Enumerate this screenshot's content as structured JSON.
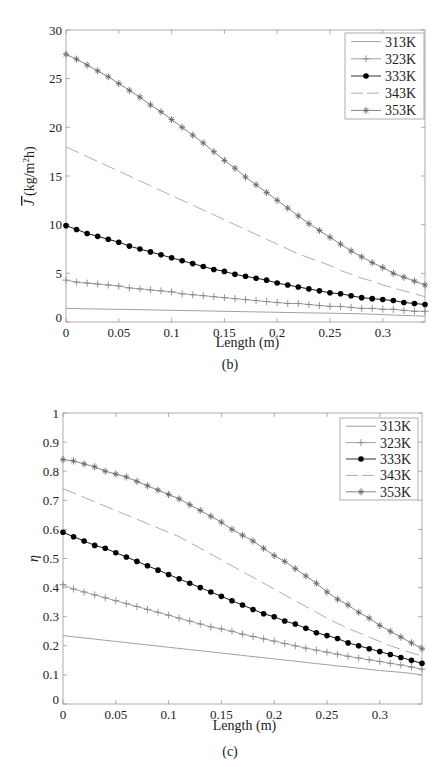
{
  "figure": {
    "panels": [
      "(b)",
      "(c)"
    ]
  },
  "chart_data": [
    {
      "id": "b",
      "type": "line",
      "caption": "(b)",
      "title": "",
      "xlabel": "Length (m)",
      "ylabel": "J̄ (kg/m²h)",
      "ylabel_parts": {
        "symbol": "J",
        "unit_pre": "(kg/m",
        "unit_sup": "2",
        "unit_post": "h)"
      },
      "xlim": [
        0,
        0.34
      ],
      "ylim": [
        0,
        30
      ],
      "xticks": [
        0,
        0.05,
        0.1,
        0.15,
        0.2,
        0.25,
        0.3
      ],
      "xtick_labels": [
        "0",
        "0.05",
        "0.1",
        "0.15",
        "0.2",
        "0.25",
        "0.3"
      ],
      "yticks": [
        0,
        5,
        10,
        15,
        20,
        25,
        30
      ],
      "ytick_labels": [
        "0",
        "5",
        "10",
        "15",
        "20",
        "25",
        "30"
      ],
      "grid": false,
      "legend_position": "upper right",
      "x": [
        0,
        0.01,
        0.02,
        0.03,
        0.04,
        0.05,
        0.06,
        0.07,
        0.08,
        0.09,
        0.1,
        0.11,
        0.12,
        0.13,
        0.14,
        0.15,
        0.16,
        0.17,
        0.18,
        0.19,
        0.2,
        0.21,
        0.22,
        0.23,
        0.24,
        0.25,
        0.26,
        0.27,
        0.28,
        0.29,
        0.3,
        0.31,
        0.32,
        0.33,
        0.34
      ],
      "series": [
        {
          "name": "313K",
          "style": "solid",
          "marker": "none",
          "color": "#888888",
          "values": [
            1.4,
            1.38,
            1.36,
            1.34,
            1.32,
            1.3,
            1.28,
            1.26,
            1.24,
            1.22,
            1.2,
            1.18,
            1.16,
            1.14,
            1.12,
            1.1,
            1.08,
            1.06,
            1.04,
            1.02,
            1.0,
            0.98,
            0.96,
            0.94,
            0.92,
            0.9,
            0.88,
            0.86,
            0.84,
            0.8,
            0.76,
            0.72,
            0.68,
            0.64,
            0.6
          ]
        },
        {
          "name": "323K",
          "style": "solid",
          "marker": "plus",
          "color": "#888888",
          "values": [
            4.3,
            4.1,
            4.0,
            3.9,
            3.8,
            3.7,
            3.5,
            3.4,
            3.3,
            3.2,
            3.1,
            2.9,
            2.8,
            2.7,
            2.6,
            2.5,
            2.4,
            2.3,
            2.2,
            2.1,
            2.0,
            1.9,
            1.9,
            1.8,
            1.7,
            1.6,
            1.6,
            1.5,
            1.4,
            1.4,
            1.3,
            1.3,
            1.2,
            1.1,
            1.1
          ]
        },
        {
          "name": "333K",
          "style": "solid",
          "marker": "dot",
          "color": "#000000",
          "values": [
            9.9,
            9.5,
            9.1,
            8.8,
            8.5,
            8.2,
            7.8,
            7.5,
            7.2,
            6.9,
            6.6,
            6.3,
            6.0,
            5.7,
            5.4,
            5.2,
            4.9,
            4.7,
            4.5,
            4.3,
            4.0,
            3.8,
            3.6,
            3.4,
            3.2,
            3.0,
            2.9,
            2.7,
            2.5,
            2.4,
            2.3,
            2.2,
            2.0,
            1.9,
            1.8
          ]
        },
        {
          "name": "343K",
          "style": "dashed",
          "marker": "none",
          "color": "#999999",
          "values": [
            18.0,
            17.5,
            17.0,
            16.5,
            16.0,
            15.5,
            15.0,
            14.5,
            14.0,
            13.5,
            13.0,
            12.5,
            12.0,
            11.5,
            11.0,
            10.5,
            10.0,
            9.5,
            9.0,
            8.5,
            8.0,
            7.5,
            7.0,
            6.6,
            6.2,
            5.8,
            5.3,
            4.9,
            4.5,
            4.2,
            3.8,
            3.5,
            3.2,
            2.9,
            2.6
          ]
        },
        {
          "name": "353K",
          "style": "solid",
          "marker": "star",
          "color": "#666666",
          "values": [
            27.5,
            27.0,
            26.4,
            25.8,
            25.2,
            24.5,
            23.8,
            23.1,
            22.3,
            21.6,
            20.8,
            20.0,
            19.2,
            18.4,
            17.5,
            16.6,
            15.8,
            14.9,
            14.1,
            13.3,
            12.5,
            11.7,
            10.9,
            10.1,
            9.4,
            8.7,
            8.0,
            7.3,
            6.7,
            6.1,
            5.6,
            5.0,
            4.6,
            4.2,
            3.8
          ]
        }
      ]
    },
    {
      "id": "c",
      "type": "line",
      "caption": "(c)",
      "title": "",
      "xlabel": "Length (m)",
      "ylabel": "η",
      "xlim": [
        0,
        0.34
      ],
      "ylim": [
        0,
        1
      ],
      "xticks": [
        0,
        0.05,
        0.1,
        0.15,
        0.2,
        0.25,
        0.3
      ],
      "xtick_labels": [
        "0",
        "0.05",
        "0.1",
        "0.15",
        "0.2",
        "0.25",
        "0.3"
      ],
      "yticks": [
        0,
        0.1,
        0.2,
        0.3,
        0.4,
        0.5,
        0.6,
        0.7,
        0.8,
        0.9,
        1
      ],
      "ytick_labels": [
        "0",
        "0.1",
        "0.2",
        "0.3",
        "0.4",
        "0.5",
        "0.6",
        "0.7",
        "0.8",
        "0.9",
        "1"
      ],
      "grid": false,
      "legend_position": "upper right",
      "x": [
        0,
        0.01,
        0.02,
        0.03,
        0.04,
        0.05,
        0.06,
        0.07,
        0.08,
        0.09,
        0.1,
        0.11,
        0.12,
        0.13,
        0.14,
        0.15,
        0.16,
        0.17,
        0.18,
        0.19,
        0.2,
        0.21,
        0.22,
        0.23,
        0.24,
        0.25,
        0.26,
        0.27,
        0.28,
        0.29,
        0.3,
        0.31,
        0.32,
        0.33,
        0.34
      ],
      "series": [
        {
          "name": "313K",
          "style": "solid",
          "marker": "none",
          "color": "#888888",
          "values": [
            0.235,
            0.231,
            0.227,
            0.223,
            0.219,
            0.215,
            0.211,
            0.207,
            0.203,
            0.199,
            0.195,
            0.191,
            0.187,
            0.183,
            0.179,
            0.175,
            0.171,
            0.167,
            0.163,
            0.159,
            0.155,
            0.151,
            0.147,
            0.143,
            0.139,
            0.135,
            0.131,
            0.127,
            0.123,
            0.119,
            0.115,
            0.112,
            0.109,
            0.105,
            0.1
          ]
        },
        {
          "name": "323K",
          "style": "solid",
          "marker": "plus",
          "color": "#888888",
          "values": [
            0.41,
            0.395,
            0.385,
            0.375,
            0.365,
            0.355,
            0.345,
            0.335,
            0.325,
            0.315,
            0.305,
            0.295,
            0.285,
            0.275,
            0.265,
            0.258,
            0.25,
            0.24,
            0.232,
            0.224,
            0.216,
            0.208,
            0.2,
            0.192,
            0.185,
            0.178,
            0.171,
            0.164,
            0.158,
            0.152,
            0.146,
            0.14,
            0.134,
            0.127,
            0.12
          ]
        },
        {
          "name": "333K",
          "style": "solid",
          "marker": "dot",
          "color": "#000000",
          "values": [
            0.59,
            0.575,
            0.56,
            0.545,
            0.535,
            0.52,
            0.505,
            0.49,
            0.475,
            0.46,
            0.445,
            0.43,
            0.415,
            0.4,
            0.385,
            0.37,
            0.355,
            0.34,
            0.325,
            0.31,
            0.3,
            0.285,
            0.275,
            0.26,
            0.245,
            0.235,
            0.225,
            0.21,
            0.2,
            0.19,
            0.18,
            0.17,
            0.16,
            0.15,
            0.14
          ]
        },
        {
          "name": "343K",
          "style": "dashed",
          "marker": "none",
          "color": "#999999",
          "values": [
            0.74,
            0.725,
            0.71,
            0.695,
            0.68,
            0.665,
            0.65,
            0.635,
            0.62,
            0.605,
            0.59,
            0.575,
            0.555,
            0.535,
            0.515,
            0.495,
            0.475,
            0.455,
            0.435,
            0.415,
            0.395,
            0.375,
            0.355,
            0.335,
            0.315,
            0.295,
            0.277,
            0.26,
            0.245,
            0.23,
            0.215,
            0.2,
            0.188,
            0.176,
            0.165
          ]
        },
        {
          "name": "353K",
          "style": "solid",
          "marker": "star",
          "color": "#666666",
          "values": [
            0.84,
            0.835,
            0.825,
            0.815,
            0.8,
            0.79,
            0.78,
            0.765,
            0.75,
            0.735,
            0.72,
            0.705,
            0.685,
            0.665,
            0.645,
            0.625,
            0.6,
            0.58,
            0.56,
            0.535,
            0.51,
            0.49,
            0.465,
            0.44,
            0.415,
            0.385,
            0.36,
            0.34,
            0.315,
            0.295,
            0.27,
            0.25,
            0.23,
            0.21,
            0.19
          ]
        }
      ]
    }
  ]
}
